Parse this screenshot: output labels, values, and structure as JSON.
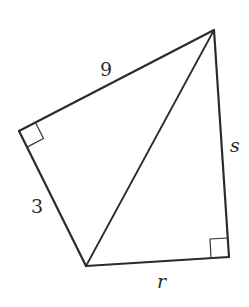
{
  "figure": {
    "type": "quadrilateral split into two right triangles by a diagonal",
    "labels": {
      "top_left_side": "9",
      "left_side": "3",
      "right_side": "s",
      "bottom_side": "r"
    },
    "right_angles": [
      "left vertex",
      "bottom-right vertex"
    ],
    "colors": {
      "stroke": "#2b2b2b",
      "background": "#ffffff"
    }
  }
}
